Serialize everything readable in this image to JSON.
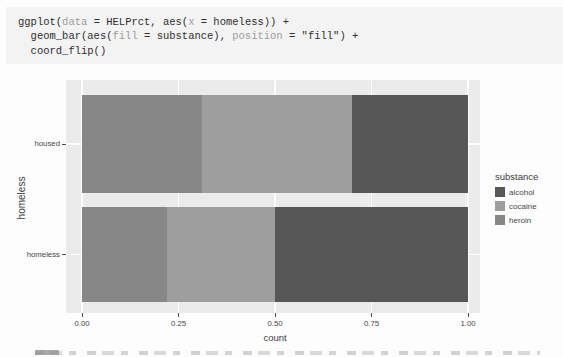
{
  "code_block": {
    "language": "r",
    "lines": [
      {
        "segments": [
          {
            "text": "ggplot(",
            "style": "plain"
          },
          {
            "text": "data",
            "style": "muted"
          },
          {
            "text": " = HELPrct, aes(",
            "style": "plain"
          },
          {
            "text": "x",
            "style": "muted"
          },
          {
            "text": " = homeless)) +",
            "style": "plain"
          }
        ]
      },
      {
        "segments": [
          {
            "text": "  geom_bar(aes(",
            "style": "plain"
          },
          {
            "text": "fill",
            "style": "muted"
          },
          {
            "text": " = substance), ",
            "style": "plain"
          },
          {
            "text": "position",
            "style": "muted"
          },
          {
            "text": " = \"fill\") +",
            "style": "plain"
          }
        ]
      },
      {
        "segments": [
          {
            "text": "  coord_flip()",
            "style": "plain"
          }
        ]
      }
    ]
  },
  "chart_data": {
    "type": "bar",
    "subtype": "stacked-fill-horizontal",
    "title": "",
    "xlabel": "count",
    "ylabel": "homeless",
    "categories": [
      "housed",
      "homeless"
    ],
    "series": [
      {
        "name": "heroin",
        "color": "#878787",
        "values": [
          0.31,
          0.22
        ]
      },
      {
        "name": "cocaine",
        "color": "#9e9e9e",
        "values": [
          0.39,
          0.28
        ]
      },
      {
        "name": "alcohol",
        "color": "#575757",
        "values": [
          0.3,
          0.5
        ]
      }
    ],
    "xlim": [
      0,
      1
    ],
    "x_ticks": [
      {
        "value": 0,
        "label": "0.00"
      },
      {
        "value": 0.25,
        "label": "0.25"
      },
      {
        "value": 0.5,
        "label": "0.50"
      },
      {
        "value": 0.75,
        "label": "0.75"
      },
      {
        "value": 1,
        "label": "1.00"
      }
    ],
    "grid": true,
    "legend": {
      "title": "substance",
      "position": "right",
      "entries": [
        {
          "label": "alcohol",
          "color": "#575757"
        },
        {
          "label": "cocaine",
          "color": "#9e9e9e"
        },
        {
          "label": "heroin",
          "color": "#878787"
        }
      ]
    }
  },
  "colors": {
    "page_bg": "#fdfdfd",
    "code_bg": "#f3f3f3",
    "code_text": "#2f2f2f",
    "code_muted": "#9d9d9d",
    "panel_bg": "#ebebeb",
    "grid_line": "#ffffff",
    "axis_text": "#474747"
  }
}
